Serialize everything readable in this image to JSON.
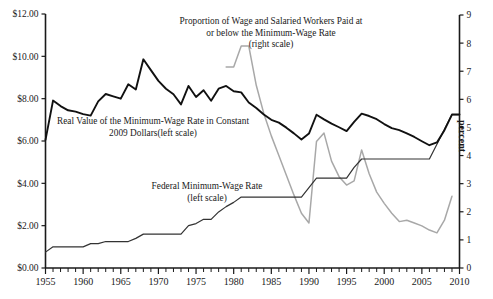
{
  "chart_data": {
    "type": "line",
    "title": "",
    "xlabel": "",
    "ylabel": "",
    "ylabel_right": "percent",
    "xlim": [
      1955,
      2010
    ],
    "ylim": [
      0,
      12
    ],
    "ylim_right": [
      0,
      9
    ],
    "grid": false,
    "legend_position": "inline-annotations",
    "x_ticks": [
      1955,
      1960,
      1965,
      1970,
      1975,
      1980,
      1985,
      1990,
      1995,
      2000,
      2005,
      2010
    ],
    "x_tick_labels": [
      "1955",
      "1960",
      "1965",
      "1970",
      "1975",
      "1980",
      "1985",
      "1990",
      "1995",
      "2000",
      "2005",
      "2010"
    ],
    "y_ticks_left": [
      0,
      2,
      4,
      6,
      8,
      10,
      12
    ],
    "y_tick_labels_left": [
      "$0.00",
      "$2.00",
      "$4.00",
      "$6.00",
      "$8.00",
      "$10.00",
      "$12.00"
    ],
    "y_ticks_right": [
      0,
      1,
      2,
      3,
      4,
      5,
      6,
      7,
      8,
      9
    ],
    "y_tick_labels_right": [
      "0",
      "1",
      "2",
      "3",
      "4",
      "5",
      "6",
      "7",
      "8",
      "9"
    ],
    "annotations": [
      {
        "name": "proportion-series-label",
        "lines": [
          "Proportion of Wage and Salaried Workers Paid at",
          "or below the Minimum-Wage Rate",
          "(right scale)"
        ]
      },
      {
        "name": "real-value-series-label",
        "lines": [
          "Real Value of the Minimum-Wage Rate in Constant",
          "2009 Dollars(left scale)"
        ]
      },
      {
        "name": "federal-minimum-wage-series-label",
        "lines": [
          "Federal Minimum-Wage Rate",
          "(left scale)"
        ]
      }
    ],
    "series": [
      {
        "name": "Real Value of the Minimum-Wage Rate in Constant 2009 Dollars",
        "axis": "left",
        "color": "#111111",
        "x": [
          1955,
          1956,
          1957,
          1958,
          1959,
          1960,
          1961,
          1962,
          1963,
          1964,
          1965,
          1966,
          1967,
          1968,
          1969,
          1970,
          1971,
          1972,
          1973,
          1974,
          1975,
          1976,
          1977,
          1978,
          1979,
          1980,
          1981,
          1982,
          1983,
          1984,
          1985,
          1986,
          1987,
          1988,
          1989,
          1990,
          1991,
          1992,
          1993,
          1994,
          1995,
          1996,
          1997,
          1998,
          1999,
          2000,
          2001,
          2002,
          2003,
          2004,
          2005,
          2006,
          2007,
          2008,
          2009,
          2010
        ],
        "values": [
          6.05,
          7.91,
          7.65,
          7.45,
          7.39,
          7.27,
          7.2,
          7.87,
          8.22,
          8.11,
          8.0,
          8.68,
          8.43,
          9.86,
          9.35,
          8.84,
          8.47,
          8.21,
          7.73,
          8.6,
          8.08,
          8.4,
          7.9,
          8.47,
          8.6,
          8.35,
          8.3,
          7.82,
          7.56,
          7.25,
          7.0,
          6.87,
          6.63,
          6.36,
          6.07,
          6.35,
          7.24,
          7.02,
          6.82,
          6.65,
          6.47,
          6.9,
          7.29,
          7.18,
          7.03,
          6.8,
          6.61,
          6.51,
          6.36,
          6.19,
          5.99,
          5.8,
          5.93,
          6.51,
          7.25,
          7.25
        ]
      },
      {
        "name": "Federal Minimum-Wage Rate",
        "axis": "left",
        "color": "#333333",
        "x": [
          1955,
          1956,
          1957,
          1958,
          1959,
          1960,
          1961,
          1962,
          1963,
          1964,
          1965,
          1966,
          1967,
          1968,
          1969,
          1970,
          1971,
          1972,
          1973,
          1974,
          1975,
          1976,
          1977,
          1978,
          1979,
          1980,
          1981,
          1982,
          1983,
          1984,
          1985,
          1986,
          1987,
          1988,
          1989,
          1990,
          1991,
          1992,
          1993,
          1994,
          1995,
          1996,
          1997,
          1998,
          1999,
          2000,
          2001,
          2002,
          2003,
          2004,
          2005,
          2006,
          2007,
          2008,
          2009,
          2010
        ],
        "values": [
          0.75,
          1.0,
          1.0,
          1.0,
          1.0,
          1.0,
          1.15,
          1.15,
          1.25,
          1.25,
          1.25,
          1.25,
          1.4,
          1.6,
          1.6,
          1.6,
          1.6,
          1.6,
          1.6,
          2.0,
          2.1,
          2.3,
          2.3,
          2.65,
          2.9,
          3.1,
          3.35,
          3.35,
          3.35,
          3.35,
          3.35,
          3.35,
          3.35,
          3.35,
          3.35,
          3.8,
          4.25,
          4.25,
          4.25,
          4.25,
          4.25,
          4.75,
          5.15,
          5.15,
          5.15,
          5.15,
          5.15,
          5.15,
          5.15,
          5.15,
          5.15,
          5.15,
          5.85,
          6.55,
          7.25,
          7.25
        ]
      },
      {
        "name": "Proportion of Wage and Salaried Workers Paid at or below the Minimum-Wage Rate",
        "axis": "right",
        "color": "#a8a8a8",
        "x": [
          1979,
          1980,
          1981,
          1982,
          1983,
          1984,
          1985,
          1986,
          1987,
          1988,
          1989,
          1990,
          1991,
          1992,
          1993,
          1994,
          1995,
          1996,
          1997,
          1998,
          1999,
          2000,
          2001,
          2002,
          2003,
          2004,
          2005,
          2006,
          2007,
          2008,
          2009
        ],
        "values": [
          7.15,
          7.15,
          7.9,
          7.9,
          6.5,
          5.5,
          4.7,
          4.0,
          3.3,
          2.6,
          1.95,
          1.6,
          4.5,
          4.8,
          3.8,
          3.25,
          2.95,
          3.1,
          4.2,
          3.35,
          2.7,
          2.3,
          1.95,
          1.65,
          1.7,
          1.6,
          1.5,
          1.35,
          1.25,
          1.7,
          2.55
        ]
      }
    ]
  }
}
